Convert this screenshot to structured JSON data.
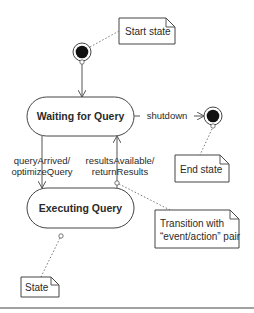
{
  "diagram": {
    "type": "UML state machine diagram",
    "states": [
      {
        "id": "waiting",
        "label": "Waiting for Query"
      },
      {
        "id": "executing",
        "label": "Executing Query"
      }
    ],
    "pseudo_states": {
      "start": {
        "label": "initial"
      },
      "end": {
        "label": "final"
      }
    },
    "transitions": [
      {
        "from": "start",
        "to": "waiting",
        "label": ""
      },
      {
        "from": "waiting",
        "to": "end",
        "label": "shutdown"
      },
      {
        "from": "waiting",
        "to": "executing",
        "event": "queryArrived/",
        "action": "optimizeQuery"
      },
      {
        "from": "executing",
        "to": "waiting",
        "event": "resultsAvailable/",
        "action": "returnResults"
      }
    ],
    "notes": {
      "start_state": "Start state",
      "end_state": "End state",
      "transition_line1": "Transition with",
      "transition_line2": "“event/action” pair",
      "state": "State"
    },
    "colors": {
      "line": "#555555",
      "fill": "#ffffff",
      "dot": "#111111",
      "text": "#2a2a2a"
    }
  }
}
